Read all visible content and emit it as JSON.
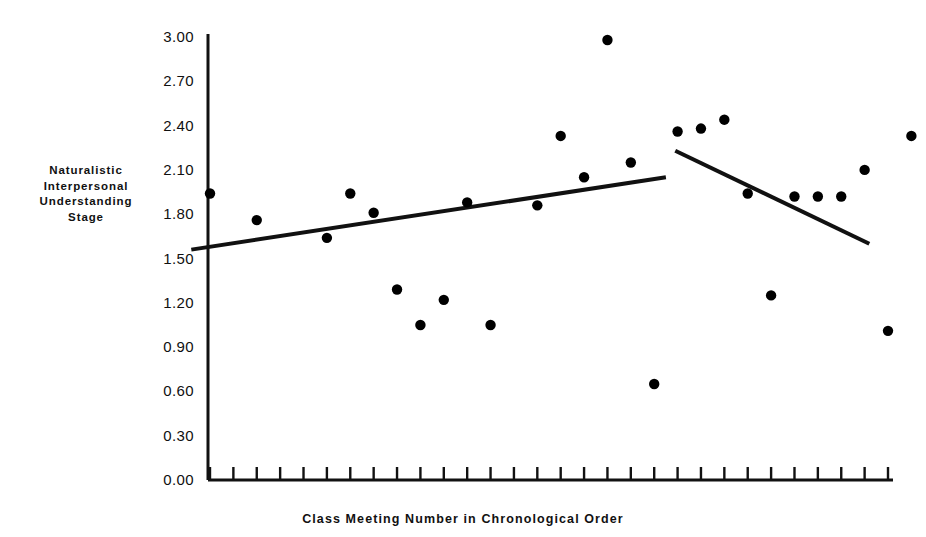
{
  "chart_data": {
    "type": "scatter",
    "title": "",
    "xlabel": "Class Meeting Number in Chronological Order",
    "ylabel": "Naturalistic Interpersonal Understanding Stage",
    "ylabel_lines": [
      "Naturalistic",
      "Interpersonal",
      "Understanding",
      "Stage"
    ],
    "ylim": [
      0.0,
      3.0
    ],
    "ytick_labels": [
      "3.00",
      "2.70",
      "2.40",
      "2.10",
      "1.80",
      "1.50",
      "1.20",
      "0.90",
      "0.60",
      "0.30",
      "0.00"
    ],
    "ytick_values": [
      3.0,
      2.7,
      2.4,
      2.1,
      1.8,
      1.5,
      1.2,
      0.9,
      0.6,
      0.3,
      0.0
    ],
    "xtick_labels": [],
    "xtick_count": 30,
    "grid": false,
    "legend": false,
    "marker": "filled-circle",
    "marker_color": "#000000",
    "points": [
      {
        "x": 1,
        "y": 1.94
      },
      {
        "x": 3,
        "y": 1.76
      },
      {
        "x": 6,
        "y": 1.64
      },
      {
        "x": 7,
        "y": 1.94
      },
      {
        "x": 8,
        "y": 1.81
      },
      {
        "x": 9,
        "y": 1.29
      },
      {
        "x": 10,
        "y": 1.05
      },
      {
        "x": 11,
        "y": 1.22
      },
      {
        "x": 12,
        "y": 1.88
      },
      {
        "x": 13,
        "y": 1.05
      },
      {
        "x": 15,
        "y": 1.86
      },
      {
        "x": 16,
        "y": 2.33
      },
      {
        "x": 17,
        "y": 2.05
      },
      {
        "x": 18,
        "y": 2.98
      },
      {
        "x": 19,
        "y": 2.15
      },
      {
        "x": 20,
        "y": 0.65
      },
      {
        "x": 21,
        "y": 2.36
      },
      {
        "x": 22,
        "y": 2.38
      },
      {
        "x": 23,
        "y": 2.44
      },
      {
        "x": 24,
        "y": 1.94
      },
      {
        "x": 25,
        "y": 1.25
      },
      {
        "x": 26,
        "y": 1.92
      },
      {
        "x": 27,
        "y": 1.92
      },
      {
        "x": 28,
        "y": 1.92
      },
      {
        "x": 29,
        "y": 2.1
      },
      {
        "x": 30,
        "y": 1.01
      },
      {
        "x": 31,
        "y": 2.33
      }
    ],
    "trend_lines": [
      {
        "name": "pre-break-trend",
        "x_start": 0.2,
        "y_start": 1.56,
        "x_end": 20.5,
        "y_end": 2.05
      },
      {
        "name": "post-break-trend",
        "x_start": 20.9,
        "y_start": 2.23,
        "x_end": 29.2,
        "y_end": 1.6
      }
    ],
    "axis_color": "#111111",
    "line_color": "#111111"
  }
}
